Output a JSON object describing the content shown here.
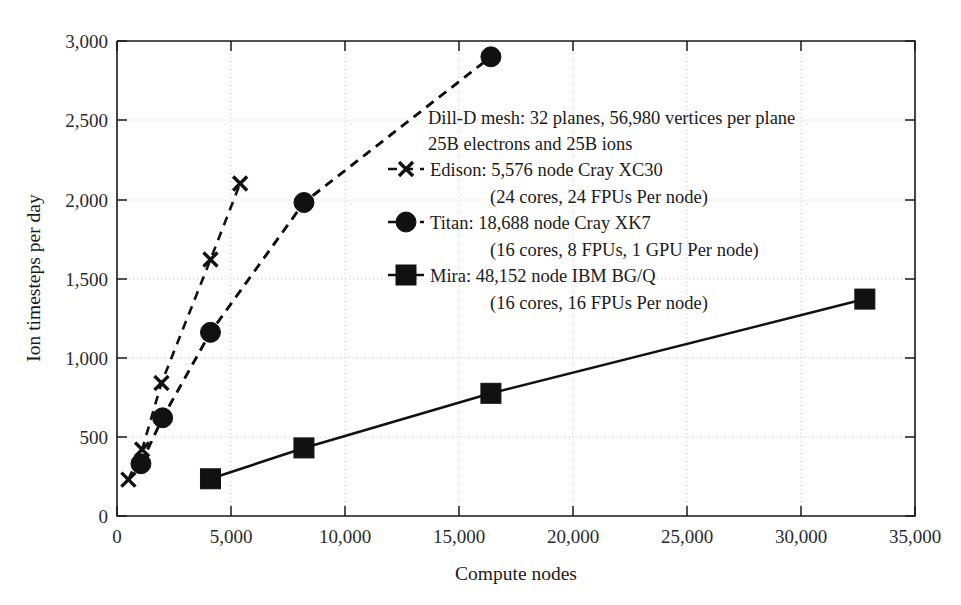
{
  "chart_data": {
    "type": "line",
    "title": "",
    "xlabel": "Compute nodes",
    "ylabel": "Ion timesteps per day",
    "xlim": [
      0,
      35000
    ],
    "ylim": [
      0,
      3000
    ],
    "grid": true,
    "legend_position": "inside-upper-right",
    "xticks": [
      "0",
      "5,000",
      "10,000",
      "15,000",
      "20,000",
      "25,000",
      "30,000",
      "35,000"
    ],
    "xtick_values": [
      0,
      5000,
      10000,
      15000,
      20000,
      25000,
      30000,
      35000
    ],
    "yticks": [
      "0",
      "500",
      "1,000",
      "1,500",
      "2,000",
      "2,500",
      "3,000"
    ],
    "ytick_values": [
      0,
      500,
      1000,
      1500,
      2000,
      2500,
      3000
    ],
    "annotations": [
      "Dill-D mesh: 32 planes, 56,980 vertices per plane",
      "25B electrons and 25B ions"
    ],
    "series": [
      {
        "name": "Edison: 5,576 node Cray XC30",
        "sublabel": "(24 cores, 24 FPUs Per node)",
        "marker": "x",
        "linestyle": "dashed",
        "color": "#111111",
        "x": [
          500,
          1100,
          1950,
          4100,
          5400
        ],
        "values": [
          230,
          420,
          840,
          1620,
          2100
        ]
      },
      {
        "name": "Titan: 18,688 node Cray XK7",
        "sublabel": "(16 cores, 8 FPUs, 1 GPU Per node)",
        "marker": "circle",
        "linestyle": "dashed",
        "color": "#111111",
        "x": [
          1050,
          2000,
          4100,
          8200,
          16400
        ],
        "values": [
          330,
          620,
          1160,
          1980,
          2900
        ]
      },
      {
        "name": "Mira: 48,152 node IBM BG/Q",
        "sublabel": "(16 cores, 16 FPUs Per node)",
        "marker": "square",
        "linestyle": "solid",
        "color": "#111111",
        "x": [
          4100,
          8200,
          16400,
          32800
        ],
        "values": [
          235,
          430,
          775,
          1370
        ]
      }
    ]
  },
  "legend": {
    "header_line_1": "Dill-D mesh: 32 planes, 56,980 vertices per plane",
    "header_line_2": "25B electrons and 25B ions",
    "entries": [
      {
        "label": "Edison: 5,576 node Cray XC30",
        "sublabel": "(24 cores, 24 FPUs Per node)",
        "marker": "x-marker-icon"
      },
      {
        "label": "Titan: 18,688 node Cray XK7",
        "sublabel": "(16 cores, 8 FPUs, 1 GPU Per node)",
        "marker": "circle-marker-icon"
      },
      {
        "label": "Mira: 48,152 node IBM BG/Q",
        "sublabel": "(16 cores, 16 FPUs Per node)",
        "marker": "square-marker-icon"
      }
    ]
  },
  "axes": {
    "x_title": "Compute nodes",
    "y_title": "Ion timesteps per day"
  }
}
